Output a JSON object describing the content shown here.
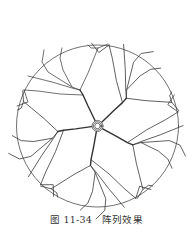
{
  "figure": {
    "type": "technical drawing",
    "center": [
      97.5,
      126
    ],
    "radius": 81,
    "array_count": 5,
    "stroke_color": "#333333",
    "background": "#ffffff"
  },
  "caption": {
    "figure_number": "图 11-34",
    "title": "阵列效果"
  }
}
